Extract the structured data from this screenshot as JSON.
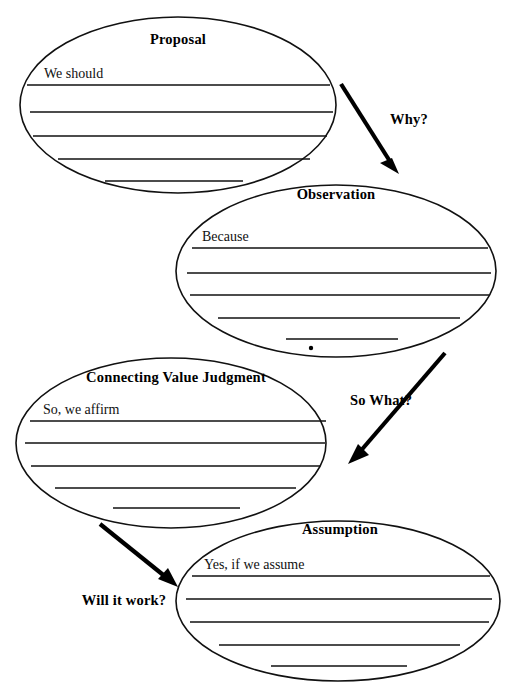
{
  "diagram": {
    "background_color": "#ffffff",
    "ink_color": "#111111",
    "nodes": [
      {
        "id": "proposal",
        "title": "Proposal",
        "prompt": "We should",
        "cx": 178,
        "cy": 105,
        "rx": 158,
        "ry": 88,
        "title_x": 178,
        "title_y": 44,
        "prompt_x": 44,
        "prompt_y": 78,
        "lines": [
          {
            "x1": 27,
            "x2": 330,
            "y": 85
          },
          {
            "x1": 30,
            "x2": 333,
            "y": 112
          },
          {
            "x1": 33,
            "x2": 327,
            "y": 136
          },
          {
            "x1": 58,
            "x2": 310,
            "y": 159
          },
          {
            "x1": 105,
            "x2": 243,
            "y": 181
          }
        ]
      },
      {
        "id": "observation",
        "title": "Observation",
        "prompt": "Because",
        "cx": 336,
        "cy": 271,
        "rx": 160,
        "ry": 86,
        "title_x": 336,
        "title_y": 199,
        "prompt_x": 202,
        "prompt_y": 241,
        "lines": [
          {
            "x1": 192,
            "x2": 488,
            "y": 248
          },
          {
            "x1": 187,
            "x2": 491,
            "y": 273
          },
          {
            "x1": 190,
            "x2": 489,
            "y": 295
          },
          {
            "x1": 218,
            "x2": 460,
            "y": 318
          },
          {
            "x1": 286,
            "x2": 398,
            "y": 339
          }
        ]
      },
      {
        "id": "connecting-value-judgment",
        "title": "Connecting Value Judgment",
        "prompt": "So, we affirm",
        "cx": 171,
        "cy": 443,
        "rx": 155,
        "ry": 85,
        "title_x": 176,
        "title_y": 382,
        "prompt_x": 43,
        "prompt_y": 414,
        "lines": [
          {
            "x1": 30,
            "x2": 326,
            "y": 421
          },
          {
            "x1": 25,
            "x2": 325,
            "y": 443
          },
          {
            "x1": 31,
            "x2": 320,
            "y": 466
          },
          {
            "x1": 55,
            "x2": 296,
            "y": 488
          },
          {
            "x1": 113,
            "x2": 240,
            "y": 508
          }
        ]
      },
      {
        "id": "assumption",
        "title": "Assumption",
        "prompt": "Yes, if we assume",
        "cx": 338,
        "cy": 601,
        "rx": 162,
        "ry": 80,
        "title_x": 340,
        "title_y": 534,
        "prompt_x": 204,
        "prompt_y": 569,
        "lines": [
          {
            "x1": 192,
            "x2": 490,
            "y": 576
          },
          {
            "x1": 186,
            "x2": 492,
            "y": 599
          },
          {
            "x1": 190,
            "x2": 489,
            "y": 622
          },
          {
            "x1": 219,
            "x2": 460,
            "y": 645
          },
          {
            "x1": 271,
            "x2": 407,
            "y": 666
          }
        ]
      }
    ],
    "arrows": [
      {
        "id": "why",
        "label": "Why?",
        "from_x": 341,
        "from_y": 84,
        "to_x": 397,
        "to_y": 172,
        "label_x": 409,
        "label_y": 124
      },
      {
        "id": "so-what",
        "label": "So What?",
        "from_x": 445,
        "from_y": 353,
        "to_x": 349,
        "to_y": 464,
        "label_x": 381,
        "label_y": 405
      },
      {
        "id": "will-it-work",
        "label": "Will it work?",
        "from_x": 100,
        "from_y": 524,
        "to_x": 177,
        "to_y": 586,
        "label_x": 124,
        "label_y": 605
      }
    ]
  }
}
